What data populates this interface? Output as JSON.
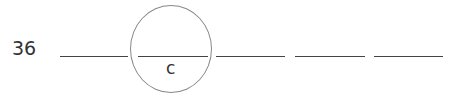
{
  "question": {
    "number": "36",
    "blanks_count": 5,
    "circled_blank_index": 1,
    "answer_letter": "c"
  }
}
